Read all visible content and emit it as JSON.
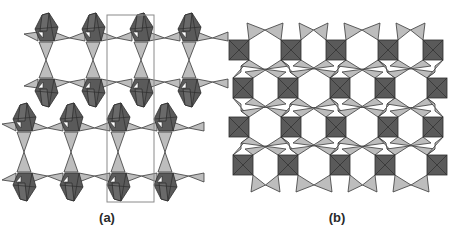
{
  "figure": {
    "colors": {
      "octahedron": "#5a5a5a",
      "octahedron_edge": "#2e2e2e",
      "tetrahedron": "#bdbdbd",
      "tetrahedron_edge": "#3a3a3a",
      "unit_cell": "#8a8a8a",
      "background": "#ffffff"
    },
    "panels": [
      {
        "id": "a",
        "label": "(a)",
        "label_pos": [
          107,
          218
        ],
        "description": "Two layers of polyhedral chains with unit cell outline",
        "unit_cell": {
          "x": 107,
          "y": 15,
          "w": 47,
          "h": 187
        },
        "layers": [
          {
            "y_top": 32,
            "y_bot": 88,
            "x_centers": [
              46,
              93,
              141,
              189
            ]
          },
          {
            "y_top": 122,
            "y_bot": 182,
            "x_centers": [
              24,
              71,
              118,
              165
            ]
          }
        ]
      },
      {
        "id": "b",
        "label": "(b)",
        "label_pos": [
          337,
          218
        ],
        "description": "Square network of octahedra linked by tetrahedra pairs",
        "square_size": 20,
        "rows": [
          {
            "y": 40,
            "x": [
              229,
              281,
              326,
              378,
              423
            ]
          },
          {
            "y": 78,
            "x": [
              233,
              278,
              330,
              375,
              427
            ]
          },
          {
            "y": 117,
            "x": [
              229,
              281,
              326,
              378,
              423
            ]
          },
          {
            "y": 155,
            "x": [
              233,
              278,
              330,
              375,
              427
            ]
          }
        ]
      }
    ]
  }
}
